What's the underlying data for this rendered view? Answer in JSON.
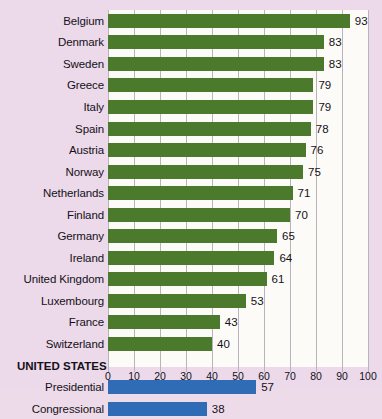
{
  "chart_data": {
    "type": "bar",
    "orientation": "horizontal",
    "title": "",
    "subtitle": "",
    "xlabel": "",
    "ylabel": "",
    "xlim": [
      0,
      100
    ],
    "ticks": [
      0,
      10,
      20,
      30,
      40,
      50,
      60,
      70,
      80,
      90,
      100
    ],
    "grid": true,
    "legend": "none",
    "categories": [
      "Belgium",
      "Denmark",
      "Sweden",
      "Greece",
      "Italy",
      "Spain",
      "Austria",
      "Norway",
      "Netherlands",
      "Finland",
      "Germany",
      "Ireland",
      "United Kingdom",
      "Luxembourg",
      "France",
      "Switzerland",
      "Presidential",
      "Congressional"
    ],
    "values": [
      93,
      83,
      83,
      79,
      79,
      78,
      76,
      75,
      71,
      70,
      65,
      64,
      61,
      53,
      43,
      40,
      57,
      38
    ],
    "section_header": "UNITED STATES",
    "colors": {
      "europe": "#4c7a2c",
      "united_states": "#2f6cb5",
      "background": "#ecd9ea",
      "plot_background": "#fcfbf7",
      "gridline": "#b9b4bb",
      "text": "#141118"
    },
    "rows": [
      {
        "label": "Belgium",
        "value": 93,
        "series": "europe",
        "type": "bar"
      },
      {
        "label": "Denmark",
        "value": 83,
        "series": "europe",
        "type": "bar"
      },
      {
        "label": "Sweden",
        "value": 83,
        "series": "europe",
        "type": "bar"
      },
      {
        "label": "Greece",
        "value": 79,
        "series": "europe",
        "type": "bar"
      },
      {
        "label": "Italy",
        "value": 79,
        "series": "europe",
        "type": "bar"
      },
      {
        "label": "Spain",
        "value": 78,
        "series": "europe",
        "type": "bar"
      },
      {
        "label": "Austria",
        "value": 76,
        "series": "europe",
        "type": "bar"
      },
      {
        "label": "Norway",
        "value": 75,
        "series": "europe",
        "type": "bar"
      },
      {
        "label": "Netherlands",
        "value": 71,
        "series": "europe",
        "type": "bar"
      },
      {
        "label": "Finland",
        "value": 70,
        "series": "europe",
        "type": "bar"
      },
      {
        "label": "Germany",
        "value": 65,
        "series": "europe",
        "type": "bar"
      },
      {
        "label": "Ireland",
        "value": 64,
        "series": "europe",
        "type": "bar"
      },
      {
        "label": "United Kingdom",
        "value": 61,
        "series": "europe",
        "type": "bar"
      },
      {
        "label": "Luxembourg",
        "value": 53,
        "series": "europe",
        "type": "bar"
      },
      {
        "label": "France",
        "value": 43,
        "series": "europe",
        "type": "bar"
      },
      {
        "label": "Switzerland",
        "value": 40,
        "series": "europe",
        "type": "bar"
      },
      {
        "label": "UNITED STATES",
        "value": null,
        "series": null,
        "type": "section"
      },
      {
        "label": "Presidential",
        "value": 57,
        "series": "united_states",
        "type": "bar"
      },
      {
        "label": "Congressional",
        "value": 38,
        "series": "united_states",
        "type": "bar"
      }
    ]
  }
}
